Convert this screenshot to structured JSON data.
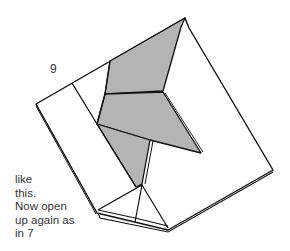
{
  "diagram": {
    "step_number": "9",
    "caption_lines": [
      "like",
      "this.",
      "Now open",
      "up again as",
      "in 7"
    ],
    "colors": {
      "line": "#111111",
      "shaded_fill": "#b4b4b4",
      "paper_fill": "#ffffff"
    }
  }
}
